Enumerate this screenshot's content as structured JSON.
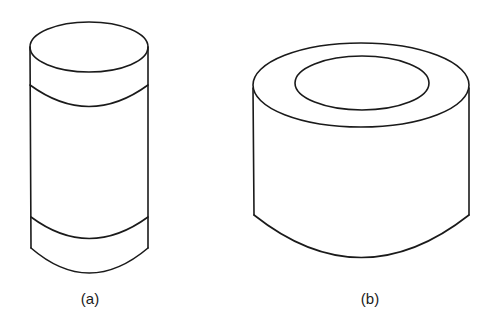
{
  "figure": {
    "panels": [
      {
        "id": "a",
        "label": "(a)",
        "shape": "solid cylinder with two bands"
      },
      {
        "id": "b",
        "label": "(b)",
        "shape": "hollow cylinder (tube / ring)"
      }
    ],
    "colors": {
      "line": "#1a1a1a",
      "background": "#ffffff"
    }
  }
}
